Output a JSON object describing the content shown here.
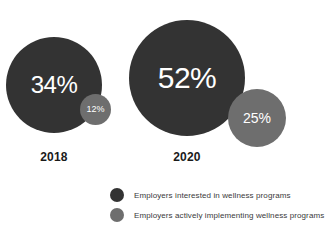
{
  "chart_data": {
    "type": "bar",
    "title": "",
    "subtitle": "",
    "xlabel": "",
    "ylabel": "",
    "categories": [
      "2018",
      "2020"
    ],
    "series": [
      {
        "name": "Employers interested in wellness programs",
        "color": "#333333",
        "values": [
          34,
          52
        ],
        "value_labels": [
          "34%",
          "12%"
        ]
      },
      {
        "name": "Employers actively implementing wellness programs",
        "color": "#6e6e6e",
        "values": [
          12,
          25
        ],
        "value_labels": [
          "25%",
          "25%"
        ]
      }
    ],
    "legend_position": "bottom",
    "grid": false,
    "units": "percent"
  },
  "groups": [
    {
      "year": "2018",
      "primary_value": "34%",
      "secondary_value": "12%"
    },
    {
      "year": "2020",
      "primary_value": "52%",
      "secondary_value": "25%"
    }
  ],
  "legend": {
    "items": [
      {
        "label": "Employers interested in wellness programs",
        "color": "#333333"
      },
      {
        "label": "Employers actively implementing wellness programs",
        "color": "#6e6e6e"
      }
    ]
  },
  "colors": {
    "primary": "#333333",
    "secondary": "#6e6e6e",
    "background": "#ffffff",
    "caption_text": "#1a1a1a",
    "legend_text": "#3a3a3a",
    "bubble_text": "#ffffff"
  }
}
